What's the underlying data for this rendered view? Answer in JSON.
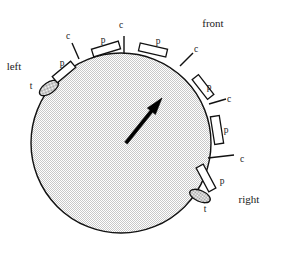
{
  "figure": {
    "title": "",
    "type": "schematic-diagram",
    "background_color": "#ffffff",
    "ink_color": "#111111",
    "fill_color": "#e3e3e3"
  },
  "disc": {
    "name": "body-disc",
    "center_x": 121,
    "center_y": 143,
    "radius": 90,
    "fill": "#e3e3e3",
    "stroke": "#111111"
  },
  "orientation_arrow": {
    "name": "heading-arrow",
    "from_x": 126,
    "from_y": 143,
    "to_x": 162,
    "to_y": 98,
    "color": "#000000"
  },
  "orientation_labels": [
    {
      "id": "front",
      "text": "front",
      "x": 213,
      "y": 27
    },
    {
      "id": "left",
      "text": "left",
      "x": 14,
      "y": 70
    },
    {
      "id": "right",
      "text": "right",
      "x": 249,
      "y": 203
    }
  ],
  "markers": [
    {
      "id": "t-left",
      "kind": "t",
      "label": "t",
      "cx": 49,
      "cy": 88,
      "angle": -35,
      "rx": 11,
      "ry": 5.5,
      "label_x": 31,
      "label_y": 89
    },
    {
      "id": "p-upper-left",
      "kind": "p",
      "label": "p",
      "cx": 64,
      "cy": 72,
      "angle": -40,
      "w": 24,
      "h": 8,
      "label_x": 62,
      "label_y": 66
    },
    {
      "id": "c-upper-left",
      "kind": "c",
      "label": "c",
      "x1": 79,
      "y1": 59,
      "x2": 72,
      "y2": 43,
      "label_x": 68,
      "label_y": 39
    },
    {
      "id": "p-top-left",
      "kind": "p",
      "label": "p",
      "cx": 106,
      "cy": 49,
      "angle": -17,
      "w": 28,
      "h": 8,
      "label_x": 103,
      "label_y": 43
    },
    {
      "id": "c-top",
      "kind": "c",
      "label": "c",
      "x1": 124,
      "y1": 54,
      "x2": 124,
      "y2": 36,
      "label_x": 121,
      "label_y": 28
    },
    {
      "id": "p-top-right",
      "kind": "p",
      "label": "p",
      "cx": 153,
      "cy": 50,
      "angle": 13,
      "w": 28,
      "h": 8,
      "label_x": 158,
      "label_y": 44
    },
    {
      "id": "c-upper-right",
      "kind": "c",
      "label": "c",
      "x1": 180,
      "y1": 66,
      "x2": 193,
      "y2": 53,
      "label_x": 196,
      "label_y": 52
    },
    {
      "id": "p-right-upper",
      "kind": "p",
      "label": "p",
      "cx": 203,
      "cy": 87,
      "angle": 52,
      "w": 25,
      "h": 8,
      "label_x": 209,
      "label_y": 90
    },
    {
      "id": "c-right-mid",
      "kind": "c",
      "label": "c",
      "x1": 209,
      "y1": 104,
      "x2": 226,
      "y2": 99,
      "label_x": 229,
      "label_y": 102
    },
    {
      "id": "p-right-lower",
      "kind": "p",
      "label": "p",
      "cx": 217,
      "cy": 130,
      "angle": 81,
      "w": 28,
      "h": 9,
      "label_x": 226,
      "label_y": 133
    },
    {
      "id": "c-right-low",
      "kind": "c",
      "label": "c",
      "x1": 208,
      "y1": 158,
      "x2": 234,
      "y2": 155,
      "label_x": 242,
      "label_y": 162
    },
    {
      "id": "p-lower-right",
      "kind": "p",
      "label": "p",
      "cx": 206,
      "cy": 178,
      "angle": 62,
      "w": 27,
      "h": 8,
      "label_x": 222,
      "label_y": 184
    },
    {
      "id": "t-right",
      "kind": "t",
      "label": "t",
      "cx": 200,
      "cy": 196,
      "angle": 24,
      "rx": 11,
      "ry": 5.5,
      "label_x": 205,
      "label_y": 212
    }
  ],
  "legend_meaning": {
    "p": "p",
    "c": "c",
    "t": "t"
  }
}
